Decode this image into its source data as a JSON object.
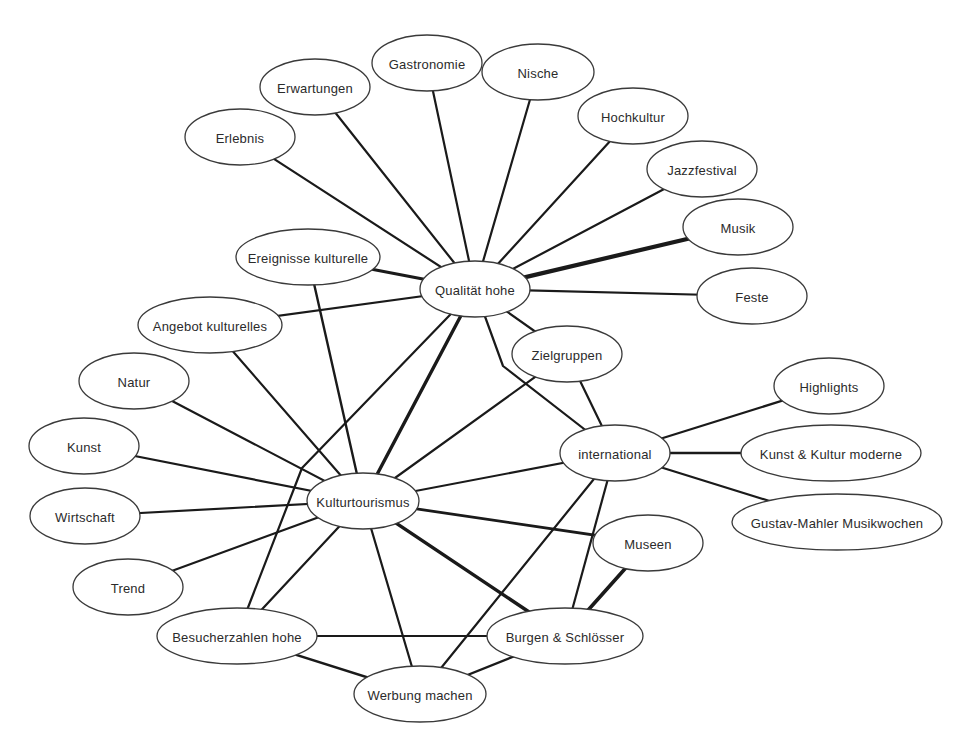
{
  "diagram": {
    "type": "concept-network",
    "nodes": [
      {
        "id": "erlebnis",
        "label": "Erlebnis",
        "cx": 240,
        "cy": 137,
        "rx": 55,
        "ry": 28
      },
      {
        "id": "erwartungen",
        "label": "Erwartungen",
        "cx": 315,
        "cy": 87,
        "rx": 55,
        "ry": 28
      },
      {
        "id": "gastronomie",
        "label": "Gastronomie",
        "cx": 427,
        "cy": 63,
        "rx": 55,
        "ry": 28
      },
      {
        "id": "nische",
        "label": "Nische",
        "cx": 538,
        "cy": 72,
        "rx": 56,
        "ry": 28
      },
      {
        "id": "hochkultur",
        "label": "Hochkultur",
        "cx": 633,
        "cy": 116,
        "rx": 55,
        "ry": 28
      },
      {
        "id": "jazzfestival",
        "label": "Jazzfestival",
        "cx": 702,
        "cy": 169,
        "rx": 55,
        "ry": 28
      },
      {
        "id": "musik",
        "label": "Musik",
        "cx": 738,
        "cy": 227,
        "rx": 55,
        "ry": 28
      },
      {
        "id": "feste",
        "label": "Feste",
        "cx": 752,
        "cy": 296,
        "rx": 55,
        "ry": 28
      },
      {
        "id": "ereignisse",
        "label": "Ereignisse kulturelle",
        "cx": 308,
        "cy": 257,
        "rx": 72,
        "ry": 28
      },
      {
        "id": "qualitaet",
        "label": "Qualität hohe",
        "cx": 475,
        "cy": 289,
        "rx": 55,
        "ry": 28
      },
      {
        "id": "angebot",
        "label": "Angebot kulturelles",
        "cx": 210,
        "cy": 325,
        "rx": 72,
        "ry": 28
      },
      {
        "id": "zielgruppen",
        "label": "Zielgruppen",
        "cx": 567,
        "cy": 354,
        "rx": 55,
        "ry": 28
      },
      {
        "id": "natur",
        "label": "Natur",
        "cx": 134,
        "cy": 381,
        "rx": 55,
        "ry": 28
      },
      {
        "id": "kunst",
        "label": "Kunst",
        "cx": 84,
        "cy": 446,
        "rx": 55,
        "ry": 28
      },
      {
        "id": "highlights",
        "label": "Highlights",
        "cx": 829,
        "cy": 386,
        "rx": 55,
        "ry": 28
      },
      {
        "id": "international",
        "label": "international",
        "cx": 615,
        "cy": 453,
        "rx": 55,
        "ry": 28
      },
      {
        "id": "kunstkultur",
        "label": "Kunst & Kultur moderne",
        "cx": 831,
        "cy": 453,
        "rx": 90,
        "ry": 28
      },
      {
        "id": "wirtschaft",
        "label": "Wirtschaft",
        "cx": 85,
        "cy": 516,
        "rx": 55,
        "ry": 28
      },
      {
        "id": "kulturtourismus",
        "label": "Kulturtourismus",
        "cx": 363,
        "cy": 501,
        "rx": 56,
        "ry": 28
      },
      {
        "id": "mahler",
        "label": "Gustav-Mahler Musikwochen",
        "cx": 837,
        "cy": 522,
        "rx": 105,
        "ry": 28
      },
      {
        "id": "museen",
        "label": "Museen",
        "cx": 648,
        "cy": 543,
        "rx": 55,
        "ry": 28
      },
      {
        "id": "trend",
        "label": "Trend",
        "cx": 128,
        "cy": 587,
        "rx": 55,
        "ry": 28
      },
      {
        "id": "besucherzahlen",
        "label": "Besucherzahlen hohe",
        "cx": 237,
        "cy": 636,
        "rx": 80,
        "ry": 28
      },
      {
        "id": "burgen",
        "label": "Burgen & Schlösser",
        "cx": 565,
        "cy": 636,
        "rx": 78,
        "ry": 28
      },
      {
        "id": "werbung",
        "label": "Werbung machen",
        "cx": 420,
        "cy": 694,
        "rx": 66,
        "ry": 28
      }
    ],
    "edges": [
      {
        "from": "qualitaet",
        "to": "erlebnis",
        "w": 2.2
      },
      {
        "from": "qualitaet",
        "to": "erwartungen",
        "w": 2.2
      },
      {
        "from": "qualitaet",
        "to": "gastronomie",
        "w": 2.2
      },
      {
        "from": "qualitaet",
        "to": "nische",
        "w": 2.2
      },
      {
        "from": "qualitaet",
        "to": "hochkultur",
        "w": 2.2
      },
      {
        "from": "qualitaet",
        "to": "jazzfestival",
        "w": 2.2
      },
      {
        "from": "qualitaet",
        "to": "musik",
        "w": 4.2
      },
      {
        "from": "qualitaet",
        "to": "feste",
        "w": 2.2
      },
      {
        "from": "qualitaet",
        "to": "ereignisse",
        "w": 3.2
      },
      {
        "from": "qualitaet",
        "to": "angebot",
        "w": 2.2
      },
      {
        "from": "qualitaet",
        "to": "zielgruppen",
        "w": 2.2
      },
      {
        "from": "qualitaet",
        "to": "kulturtourismus",
        "w": 3.4
      },
      {
        "from": "qualitaet",
        "to": "international",
        "w": 2.2,
        "via": [
          [
            503,
            366
          ]
        ]
      },
      {
        "from": "qualitaet",
        "to": "besucherzahlen",
        "w": 2.2,
        "via": [
          [
            302,
            468
          ]
        ]
      },
      {
        "from": "ereignisse",
        "to": "kulturtourismus",
        "w": 2.4
      },
      {
        "from": "angebot",
        "to": "kulturtourismus",
        "w": 2.2
      },
      {
        "from": "zielgruppen",
        "to": "kulturtourismus",
        "w": 2.2
      },
      {
        "from": "zielgruppen",
        "to": "international",
        "w": 2.2
      },
      {
        "from": "natur",
        "to": "kulturtourismus",
        "w": 2.2
      },
      {
        "from": "kunst",
        "to": "kulturtourismus",
        "w": 2.2
      },
      {
        "from": "wirtschaft",
        "to": "kulturtourismus",
        "w": 2.2
      },
      {
        "from": "trend",
        "to": "kulturtourismus",
        "w": 2.2
      },
      {
        "from": "international",
        "to": "kulturtourismus",
        "w": 2.2
      },
      {
        "from": "international",
        "to": "highlights",
        "w": 2.2
      },
      {
        "from": "international",
        "to": "kunstkultur",
        "w": 2.6
      },
      {
        "from": "international",
        "to": "mahler",
        "w": 2.2
      },
      {
        "from": "international",
        "to": "werbung",
        "w": 2.2
      },
      {
        "from": "international",
        "to": "burgen",
        "w": 2.2
      },
      {
        "from": "kulturtourismus",
        "to": "museen",
        "w": 2.8
      },
      {
        "from": "kulturtourismus",
        "to": "burgen",
        "w": 3.4
      },
      {
        "from": "kulturtourismus",
        "to": "werbung",
        "w": 2.2
      },
      {
        "from": "kulturtourismus",
        "to": "besucherzahlen",
        "w": 2.2
      },
      {
        "from": "museen",
        "to": "burgen",
        "w": 3.6
      },
      {
        "from": "besucherzahlen",
        "to": "burgen",
        "w": 2.2
      },
      {
        "from": "besucherzahlen",
        "to": "werbung",
        "w": 2.4
      },
      {
        "from": "burgen",
        "to": "werbung",
        "w": 2.4
      }
    ]
  },
  "colors": {
    "background": "#ffffff",
    "edge": "#1a1a1a",
    "node_stroke": "#3a3a3a",
    "node_fill": "#ffffff",
    "text": "#2b2b2b"
  }
}
